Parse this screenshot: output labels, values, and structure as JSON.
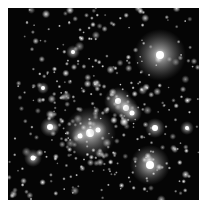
{
  "image": {
    "subject": "star cluster",
    "background": "#050505",
    "frame": {
      "x": 8,
      "y": 8,
      "w": 191,
      "h": 192
    }
  },
  "bright_stars": [
    {
      "x": 152,
      "y": 47,
      "r": 26,
      "core": 4
    },
    {
      "x": 142,
      "y": 157,
      "r": 20,
      "core": 4
    },
    {
      "x": 82,
      "y": 125,
      "r": 26,
      "core": 4
    },
    {
      "x": 110,
      "y": 93,
      "r": 14,
      "core": 3
    },
    {
      "x": 118,
      "y": 100,
      "r": 12,
      "core": 3
    },
    {
      "x": 124,
      "y": 105,
      "r": 10,
      "core": 2.5
    },
    {
      "x": 42,
      "y": 119,
      "r": 10,
      "core": 3
    },
    {
      "x": 147,
      "y": 120,
      "r": 10,
      "core": 3
    },
    {
      "x": 25,
      "y": 150,
      "r": 9,
      "core": 2.5
    },
    {
      "x": 179,
      "y": 120,
      "r": 7,
      "core": 2
    },
    {
      "x": 65,
      "y": 44,
      "r": 7,
      "core": 2
    },
    {
      "x": 72,
      "y": 128,
      "r": 9,
      "core": 2.5
    },
    {
      "x": 90,
      "y": 122,
      "r": 9,
      "core": 2.5
    },
    {
      "x": 35,
      "y": 80,
      "r": 6,
      "core": 2
    }
  ]
}
